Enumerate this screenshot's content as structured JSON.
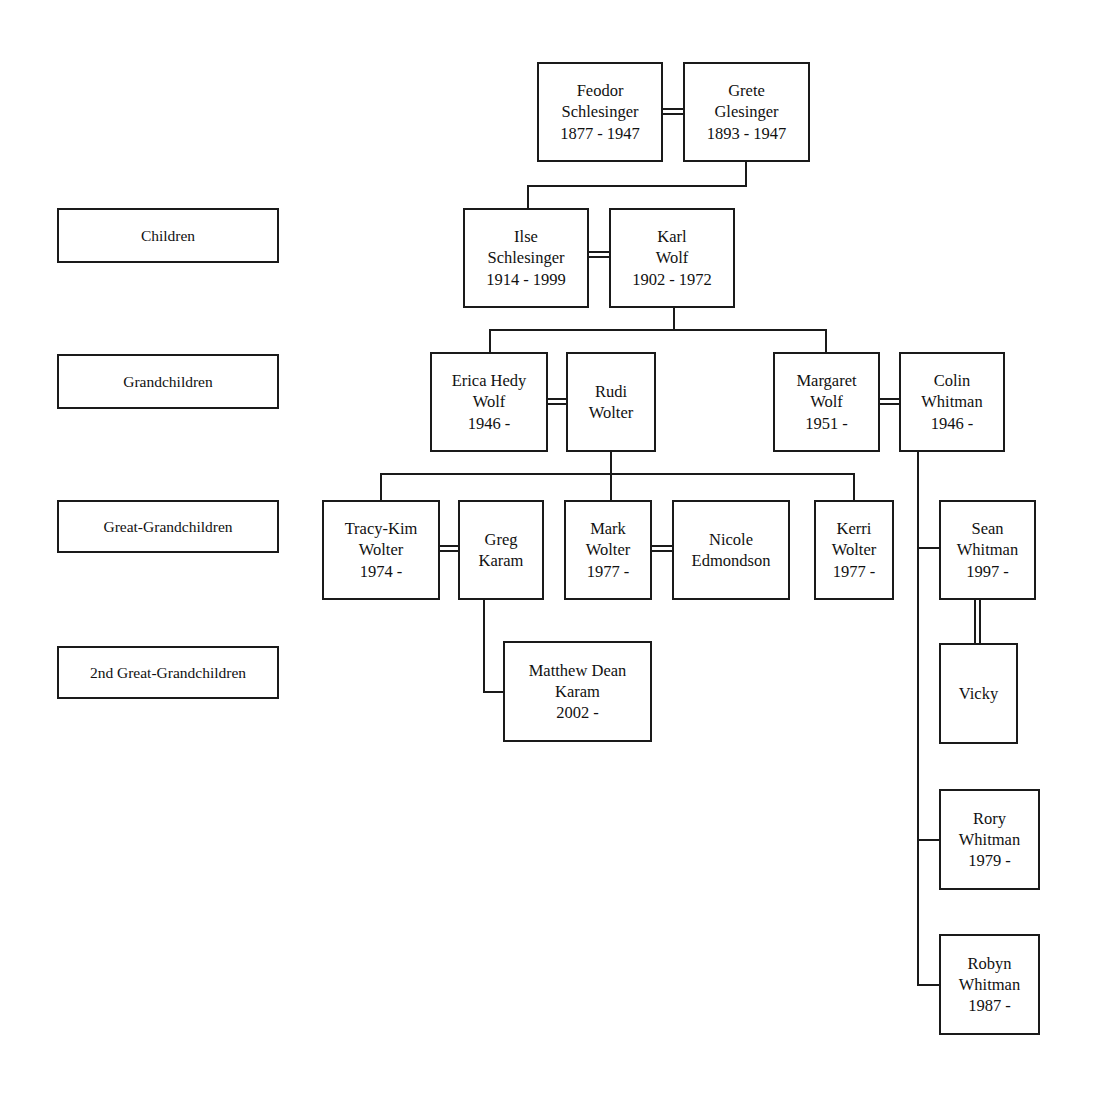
{
  "diagram": {
    "line_color": "#1a1a1a",
    "background_color": "#ffffff"
  },
  "legend": {
    "children": "Children",
    "grandchildren": "Grandchildren",
    "great_grandchildren": "Great-Grandchildren",
    "second_great_grandchildren": "2nd Great-Grandchildren"
  },
  "people": {
    "feodor": {
      "line1": "Feodor",
      "line2": "Schlesinger",
      "line3": "1877 - 1947"
    },
    "grete": {
      "line1": "Grete",
      "line2": "Glesinger",
      "line3": "1893 - 1947"
    },
    "ilse": {
      "line1": "Ilse",
      "line2": "Schlesinger",
      "line3": "1914 - 1999"
    },
    "karl": {
      "line1": "Karl",
      "line2": "Wolf",
      "line3": "1902 - 1972"
    },
    "erica": {
      "line1": "Erica Hedy",
      "line2": "Wolf",
      "line3": "1946 -"
    },
    "rudi": {
      "line1": "Rudi",
      "line2": "Wolter",
      "line3": ""
    },
    "margaret": {
      "line1": "Margaret",
      "line2": "Wolf",
      "line3": "1951 -"
    },
    "colin": {
      "line1": "Colin",
      "line2": "Whitman",
      "line3": "1946 -"
    },
    "tracykim": {
      "line1": "Tracy-Kim",
      "line2": "Wolter",
      "line3": "1974 -"
    },
    "greg": {
      "line1": "Greg",
      "line2": "Karam",
      "line3": ""
    },
    "mark": {
      "line1": "Mark",
      "line2": "Wolter",
      "line3": "1977 -"
    },
    "nicole": {
      "line1": "Nicole",
      "line2": "Edmondson",
      "line3": ""
    },
    "kerri": {
      "line1": "Kerri",
      "line2": "Wolter",
      "line3": "1977 -"
    },
    "sean": {
      "line1": "Sean",
      "line2": "Whitman",
      "line3": "1997 -"
    },
    "vicky": {
      "line1": "Vicky",
      "line2": "",
      "line3": ""
    },
    "matthew": {
      "line1": "Matthew Dean",
      "line2": "Karam",
      "line3": "2002 -"
    },
    "rory": {
      "line1": "Rory",
      "line2": "Whitman",
      "line3": "1979 -"
    },
    "robyn": {
      "line1": "Robyn",
      "line2": "Whitman",
      "line3": "1987 -"
    }
  }
}
